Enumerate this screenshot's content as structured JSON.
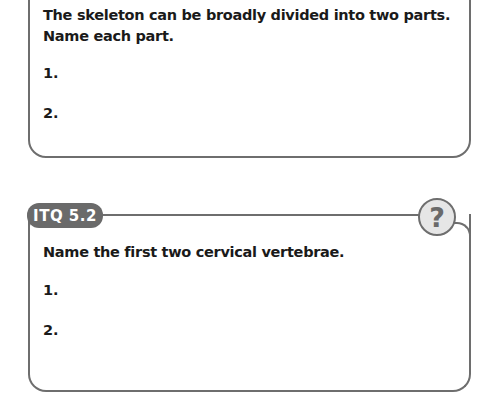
{
  "cards": [
    {
      "question": "The skeleton can be broadly divided into two parts. Name each part.",
      "answers": [
        "1.",
        "2."
      ]
    },
    {
      "label": "ITQ 5.2",
      "icon": "question-mark-icon",
      "icon_glyph": "?",
      "question": "Name the first two cervical vertebrae.",
      "answers": [
        "1.",
        "2."
      ]
    }
  ],
  "colors": {
    "border": "#6e6e6e",
    "label_bg": "#6a6a6a",
    "icon_bg": "#e6e6e6"
  }
}
